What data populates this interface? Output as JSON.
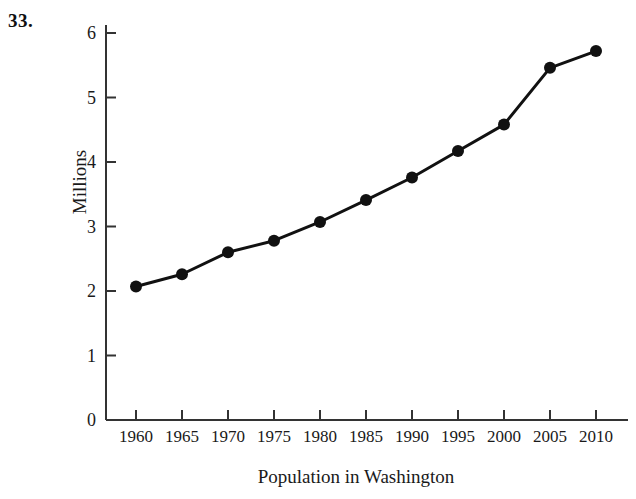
{
  "problem": {
    "number": "33."
  },
  "chart_data": {
    "type": "line",
    "title": "",
    "xlabel": "Population in Washington",
    "ylabel": "Millions",
    "categories": [
      1960,
      1965,
      1970,
      1975,
      1980,
      1985,
      1990,
      1995,
      2000,
      2005,
      2010
    ],
    "x_tick_labels": [
      "1960",
      "1965",
      "1970",
      "1975",
      "1980",
      "1985",
      "1990",
      "1995",
      "2000",
      "2005",
      "2010"
    ],
    "y_tick_labels": [
      "0",
      "1",
      "2",
      "3",
      "4",
      "5",
      "6"
    ],
    "y_ticks": [
      0,
      1,
      2,
      3,
      4,
      5,
      6
    ],
    "values": [
      2.07,
      2.26,
      2.6,
      2.78,
      3.07,
      3.41,
      3.76,
      4.17,
      4.58,
      5.46,
      5.72
    ],
    "series": [
      {
        "name": "Population in Washington",
        "values": [
          2.07,
          2.26,
          2.6,
          2.78,
          3.07,
          3.41,
          3.76,
          4.17,
          4.58,
          5.46,
          5.72
        ]
      }
    ],
    "xlim": [
      1957.5,
      2012.5
    ],
    "ylim": [
      0,
      6.3
    ],
    "grid": false,
    "legend": false,
    "legend_position": "none",
    "marker": "filled-circle",
    "line_color": "#111111",
    "marker_color": "#111111",
    "axis_color": "#333333",
    "tick_direction": "in"
  }
}
